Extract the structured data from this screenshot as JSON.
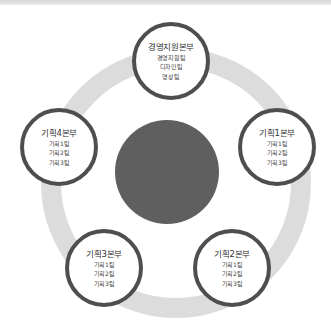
{
  "diagram": {
    "center": {
      "label": ""
    },
    "nodes": [
      {
        "id": "top",
        "title": "경영지원본부",
        "items": [
          "경영지원팀",
          "디자인팀",
          "영상팀"
        ]
      },
      {
        "id": "right",
        "title": "기획1본부",
        "items": [
          "기획1팀",
          "기획2팀",
          "기획3팀"
        ]
      },
      {
        "id": "bottom-right",
        "title": "기획2본부",
        "items": [
          "기획1팀",
          "기획2팀",
          "기획3팀"
        ]
      },
      {
        "id": "bottom-left",
        "title": "기획3본부",
        "items": [
          "기획1팀",
          "기획2팀",
          "기획3팀"
        ]
      },
      {
        "id": "left",
        "title": "기획4본부",
        "items": [
          "기획1팀",
          "기획2팀",
          "기획3팀"
        ]
      }
    ],
    "colors": {
      "ring": "#dcdcdc",
      "core": "#5f5f5f",
      "node_border": "#4e4e4e"
    }
  }
}
